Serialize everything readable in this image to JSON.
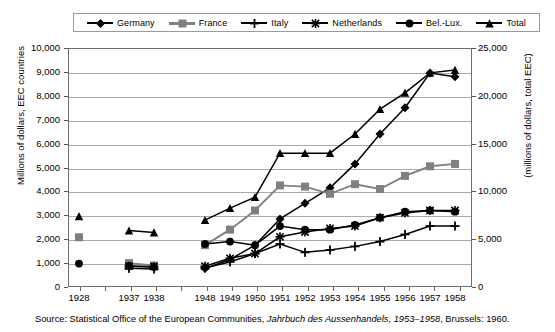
{
  "legend": {
    "items": [
      {
        "label": "Germany",
        "icon": "diamond-marker",
        "color": "#000000",
        "shape": "diamond"
      },
      {
        "label": "France",
        "icon": "square-marker",
        "color": "#808080",
        "shape": "square"
      },
      {
        "label": "Italy",
        "icon": "plus-marker",
        "color": "#000000",
        "shape": "plus"
      },
      {
        "label": "Netherlands",
        "icon": "asterisk-marker",
        "color": "#000000",
        "shape": "asterisk"
      },
      {
        "label": "Bel.-Lux.",
        "icon": "circle-marker",
        "color": "#000000",
        "shape": "circle"
      },
      {
        "label": "Total",
        "icon": "triangle-marker",
        "color": "#000000",
        "shape": "triangle"
      }
    ]
  },
  "axes": {
    "left_title": "Millions of dollars, EEC countries",
    "right_title": "(millions of dollars, total EEC)",
    "left_ticks": [
      "10,000",
      "9,000",
      "8,000",
      "7,000",
      "6,000",
      "5,000",
      "4,000",
      "3,000",
      "2,000",
      "1,000",
      "0"
    ],
    "right_ticks": [
      "25,000",
      "20,000",
      "15,000",
      "10,000",
      "5,000",
      "0"
    ],
    "x_ticks": [
      "1928",
      "1937",
      "1938",
      "1948",
      "1949",
      "1950",
      "1951",
      "1952",
      "1953",
      "1954",
      "1955",
      "1956",
      "1957",
      "1958"
    ]
  },
  "source": {
    "prefix": "Source: Statistical Office of the European Communities, ",
    "italic": "Jahrbuch des Aussenhandels, 1953–1958",
    "suffix": ", Brussels: 1960."
  },
  "chart_data": {
    "type": "line",
    "title": "",
    "xlabel": "",
    "ylabel": "Millions of dollars, EEC countries",
    "ylabel_right": "(millions of dollars, total EEC)",
    "ylim": [
      0,
      10000
    ],
    "ylim_right": [
      0,
      25000
    ],
    "yticks": [
      0,
      1000,
      2000,
      3000,
      4000,
      5000,
      6000,
      7000,
      8000,
      9000,
      10000
    ],
    "yticks_right": [
      0,
      5000,
      10000,
      15000,
      20000,
      25000
    ],
    "grid": true,
    "legend_position": "top",
    "categories": [
      "1928",
      "1937",
      "1938",
      "1948",
      "1949",
      "1950",
      "1951",
      "1952",
      "1953",
      "1954",
      "1955",
      "1956",
      "1957",
      "1958"
    ],
    "x_gap_after": [
      "1928",
      "1938"
    ],
    "series": [
      {
        "name": "Germany",
        "axis": "left",
        "color": "#000000",
        "marker": "diamond",
        "values": [
          null,
          null,
          null,
          770,
          1150,
          1750,
          2850,
          3500,
          4150,
          5150,
          6400,
          7500,
          8950,
          8800
        ]
      },
      {
        "name": "France",
        "axis": "left",
        "color": "#808080",
        "marker": "square",
        "values": [
          2080,
          1000,
          900,
          1750,
          2400,
          3200,
          4250,
          4200,
          3900,
          4300,
          4100,
          4650,
          5050,
          5150
        ]
      },
      {
        "name": "Italy",
        "axis": "left",
        "color": "#000000",
        "marker": "plus",
        "values": [
          null,
          780,
          750,
          800,
          1050,
          1400,
          1800,
          1450,
          1550,
          1700,
          1900,
          2200,
          2550,
          2550
        ]
      },
      {
        "name": "Netherlands",
        "axis": "left",
        "color": "#000000",
        "marker": "asterisk",
        "values": [
          null,
          870,
          850,
          870,
          1200,
          1400,
          2100,
          2300,
          2450,
          2550,
          2900,
          3100,
          3200,
          3200
        ]
      },
      {
        "name": "Bel.-Lux.",
        "axis": "left",
        "color": "#000000",
        "marker": "circle",
        "values": [
          980,
          880,
          840,
          1800,
          1900,
          1750,
          2550,
          2400,
          2400,
          2600,
          2900,
          3150,
          3200,
          3150
        ]
      },
      {
        "name": "Total",
        "axis": "right",
        "color": "#000000",
        "marker": "triangle",
        "values": [
          7400,
          5900,
          5700,
          7000,
          8250,
          9400,
          14000,
          14000,
          14000,
          16000,
          18600,
          20300,
          22400,
          22700
        ]
      }
    ]
  }
}
